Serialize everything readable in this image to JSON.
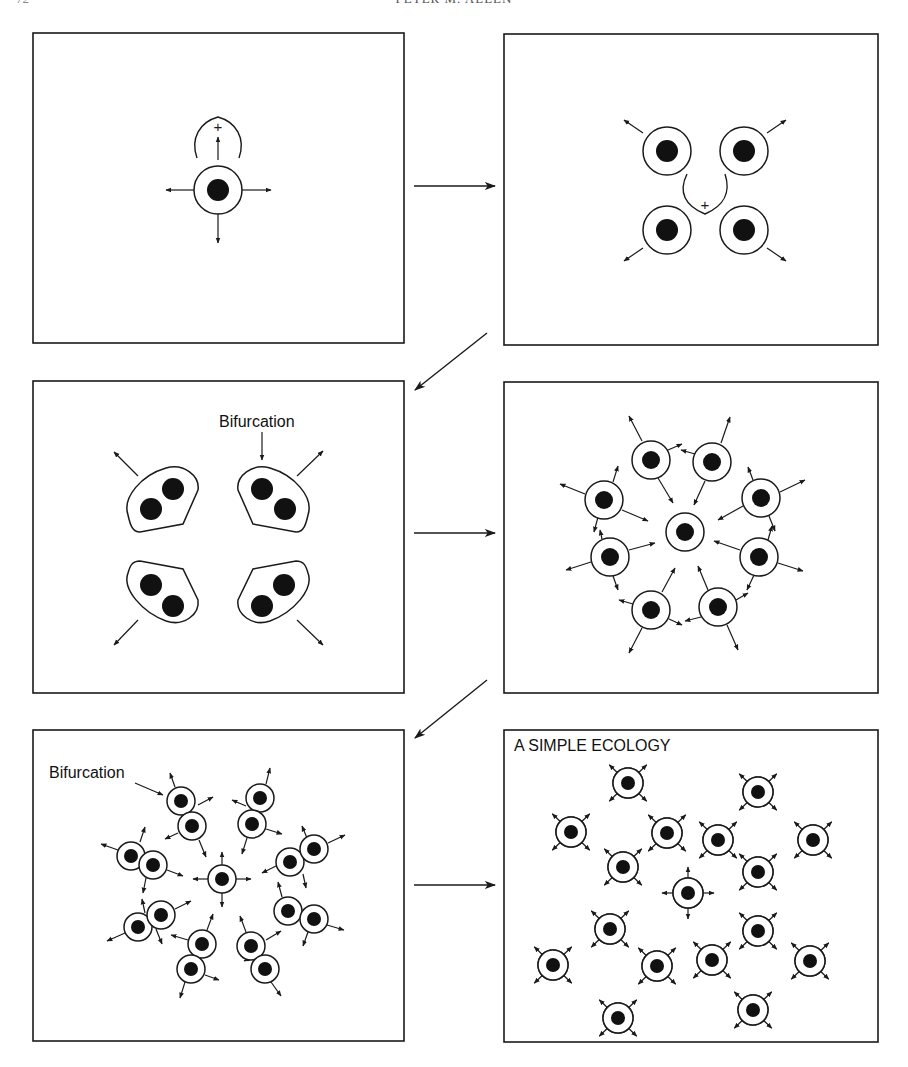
{
  "header": {
    "page_number": "72",
    "running_head": "PETER M. ALLEN"
  },
  "colors": {
    "stroke": "#1a1a1a",
    "nucleus": "#111111",
    "background": "#ffffff"
  },
  "panels": [
    {
      "id": "panel-1",
      "box": [
        33,
        33,
        371,
        310
      ],
      "label": "",
      "cells": [
        {
          "x": 218,
          "y": 190,
          "r": 24,
          "n": 11
        }
      ],
      "arrows": [
        [
          218,
          160,
          218,
          137
        ],
        [
          195,
          190,
          166,
          190
        ],
        [
          241,
          190,
          271,
          190
        ],
        [
          218,
          214,
          218,
          243
        ]
      ],
      "curves": [
        {
          "d": "M197,158 C190,138 200,122 218,117 C236,122 246,138 239,158"
        }
      ],
      "plus": [
        {
          "x": 218,
          "y": 127
        }
      ]
    },
    {
      "id": "panel-2",
      "box": [
        504,
        34,
        374,
        311
      ],
      "label": "",
      "cells": [
        {
          "x": 667,
          "y": 151,
          "r": 24,
          "n": 11
        },
        {
          "x": 744,
          "y": 151,
          "r": 24,
          "n": 11
        },
        {
          "x": 667,
          "y": 230,
          "r": 24,
          "n": 11
        },
        {
          "x": 744,
          "y": 230,
          "r": 24,
          "n": 11
        }
      ],
      "arrows": [
        [
          643,
          133,
          624,
          120
        ],
        [
          767,
          133,
          786,
          120
        ],
        [
          643,
          248,
          624,
          261
        ],
        [
          767,
          248,
          786,
          261
        ]
      ],
      "curves": [
        {
          "d": "M687,174 C678,192 685,206 705,214 C724,206 731,192 725,174"
        }
      ],
      "plus": [
        {
          "x": 705,
          "y": 205
        }
      ]
    },
    {
      "id": "panel-3",
      "box": [
        33,
        381,
        371,
        312
      ],
      "label": "Bifurcation",
      "label_pos": [
        219,
        427
      ],
      "label_arrow": [
        262,
        432,
        262,
        460
      ],
      "blobs": [
        {
          "d": "M128,515 C122,497 142,475 166,468 C184,463 200,476 198,490 L183,524 L140,532 C132,532 130,524 128,515 Z",
          "nuclei": [
            [
              173,
              489
            ],
            [
              151,
              509
            ]
          ]
        },
        {
          "d": "M308,515 C314,497 294,475 270,468 C252,463 236,476 238,490 L253,524 L296,532 C304,532 306,524 308,515 Z",
          "nuclei": [
            [
              262,
              489
            ],
            [
              285,
              509
            ]
          ]
        },
        {
          "d": "M128,573 C122,589 142,612 166,621 C184,627 200,614 198,600 L183,569 L140,561 C132,561 130,566 128,573 Z",
          "nuclei": [
            [
              151,
              585
            ],
            [
              173,
              606
            ]
          ]
        },
        {
          "d": "M308,573 C314,589 294,612 270,621 C252,627 236,614 238,600 L253,569 L296,561 C304,561 306,566 308,573 Z",
          "nuclei": [
            [
              284,
              585
            ],
            [
              262,
              606
            ]
          ]
        }
      ],
      "arrows": [
        [
          138,
          476,
          114,
          452
        ],
        [
          297,
          476,
          323,
          451
        ],
        [
          138,
          620,
          114,
          645
        ],
        [
          297,
          620,
          323,
          645
        ]
      ]
    },
    {
      "id": "panel-4",
      "box": [
        504,
        382,
        374,
        311
      ],
      "label": "",
      "cells": [
        {
          "x": 685,
          "y": 532,
          "r": 19,
          "n": 9
        },
        {
          "x": 651,
          "y": 460,
          "r": 19,
          "n": 9
        },
        {
          "x": 712,
          "y": 462,
          "r": 19,
          "n": 9
        },
        {
          "x": 604,
          "y": 500,
          "r": 19,
          "n": 9
        },
        {
          "x": 761,
          "y": 498,
          "r": 19,
          "n": 9
        },
        {
          "x": 610,
          "y": 557,
          "r": 19,
          "n": 9
        },
        {
          "x": 759,
          "y": 557,
          "r": 19,
          "n": 9
        },
        {
          "x": 651,
          "y": 610,
          "r": 19,
          "n": 9
        },
        {
          "x": 718,
          "y": 607,
          "r": 19,
          "n": 9
        }
      ],
      "arrows": [
        [
          642,
          441,
          629,
          416
        ],
        [
          668,
          450,
          682,
          444
        ],
        [
          658,
          478,
          673,
          503
        ],
        [
          721,
          443,
          730,
          417
        ],
        [
          695,
          454,
          681,
          450
        ],
        [
          705,
          481,
          694,
          505
        ],
        [
          585,
          494,
          560,
          484
        ],
        [
          613,
          482,
          618,
          466
        ],
        [
          622,
          510,
          648,
          521
        ],
        [
          598,
          517,
          594,
          532
        ],
        [
          780,
          492,
          805,
          480
        ],
        [
          753,
          480,
          748,
          467
        ],
        [
          743,
          506,
          718,
          520
        ],
        [
          769,
          516,
          775,
          531
        ],
        [
          591,
          562,
          566,
          570
        ],
        [
          629,
          550,
          655,
          543
        ],
        [
          613,
          576,
          618,
          590
        ],
        [
          602,
          539,
          600,
          530
        ],
        [
          778,
          563,
          803,
          571
        ],
        [
          740,
          550,
          714,
          541
        ],
        [
          768,
          540,
          772,
          526
        ],
        [
          754,
          575,
          747,
          590
        ],
        [
          642,
          628,
          629,
          653
        ],
        [
          662,
          592,
          675,
          568
        ],
        [
          633,
          604,
          619,
          600
        ],
        [
          669,
          619,
          682,
          625
        ],
        [
          727,
          625,
          738,
          650
        ],
        [
          708,
          590,
          698,
          566
        ],
        [
          736,
          600,
          748,
          593
        ],
        [
          701,
          617,
          685,
          621
        ]
      ]
    },
    {
      "id": "panel-5",
      "box": [
        33,
        730,
        371,
        311
      ],
      "label": "Bifurcation",
      "label_pos": [
        49,
        778
      ],
      "label_arrow": [
        135,
        783,
        163,
        795
      ],
      "cells": [
        {
          "x": 222,
          "y": 879,
          "r": 14,
          "n": 7
        },
        {
          "x": 181,
          "y": 801,
          "r": 14,
          "n": 7
        },
        {
          "x": 192,
          "y": 826,
          "r": 14,
          "n": 7
        },
        {
          "x": 260,
          "y": 798,
          "r": 14,
          "n": 7
        },
        {
          "x": 252,
          "y": 824,
          "r": 14,
          "n": 7
        },
        {
          "x": 131,
          "y": 856,
          "r": 14,
          "n": 7
        },
        {
          "x": 153,
          "y": 865,
          "r": 14,
          "n": 7
        },
        {
          "x": 290,
          "y": 862,
          "r": 14,
          "n": 7
        },
        {
          "x": 314,
          "y": 849,
          "r": 14,
          "n": 7
        },
        {
          "x": 138,
          "y": 927,
          "r": 14,
          "n": 7
        },
        {
          "x": 161,
          "y": 915,
          "r": 14,
          "n": 7
        },
        {
          "x": 288,
          "y": 911,
          "r": 14,
          "n": 7
        },
        {
          "x": 314,
          "y": 919,
          "r": 14,
          "n": 7
        },
        {
          "x": 202,
          "y": 944,
          "r": 14,
          "n": 7
        },
        {
          "x": 191,
          "y": 969,
          "r": 14,
          "n": 7
        },
        {
          "x": 251,
          "y": 946,
          "r": 14,
          "n": 7
        },
        {
          "x": 265,
          "y": 969,
          "r": 14,
          "n": 7
        }
      ],
      "arrows": [
        [
          222,
          865,
          222,
          852
        ],
        [
          208,
          879,
          193,
          879
        ],
        [
          236,
          879,
          251,
          879
        ],
        [
          222,
          893,
          222,
          907
        ],
        [
          175,
          787,
          170,
          773
        ],
        [
          198,
          805,
          213,
          797
        ],
        [
          178,
          833,
          165,
          839
        ],
        [
          199,
          840,
          206,
          857
        ],
        [
          266,
          784,
          270,
          768
        ],
        [
          246,
          806,
          232,
          800
        ],
        [
          266,
          829,
          282,
          834
        ],
        [
          247,
          838,
          242,
          854
        ],
        [
          118,
          850,
          101,
          844
        ],
        [
          140,
          842,
          145,
          827
        ],
        [
          167,
          870,
          183,
          876
        ],
        [
          146,
          878,
          143,
          893
        ],
        [
          328,
          843,
          345,
          835
        ],
        [
          307,
          838,
          302,
          826
        ],
        [
          276,
          866,
          262,
          873
        ],
        [
          303,
          874,
          306,
          888
        ],
        [
          125,
          933,
          107,
          941
        ],
        [
          175,
          909,
          191,
          901
        ],
        [
          145,
          913,
          142,
          899
        ],
        [
          156,
          929,
          162,
          944
        ],
        [
          327,
          925,
          344,
          930
        ],
        [
          282,
          897,
          278,
          882
        ],
        [
          300,
          907,
          285,
          901
        ],
        [
          308,
          932,
          303,
          946
        ],
        [
          207,
          930,
          213,
          914
        ],
        [
          188,
          940,
          171,
          935
        ],
        [
          185,
          982,
          180,
          998
        ],
        [
          205,
          975,
          219,
          980
        ],
        [
          246,
          932,
          240,
          916
        ],
        [
          258,
          955,
          244,
          961
        ],
        [
          271,
          982,
          281,
          996
        ],
        [
          266,
          940,
          281,
          931
        ]
      ]
    },
    {
      "id": "panel-6",
      "box": [
        504,
        730,
        374,
        312
      ],
      "label": "A SIMPLE ECOLOGY",
      "label_pos": [
        514,
        751
      ],
      "cells": [
        {
          "x": 628,
          "y": 783,
          "r": 15,
          "n": 7
        },
        {
          "x": 758,
          "y": 792,
          "r": 15,
          "n": 7
        },
        {
          "x": 571,
          "y": 832,
          "r": 15,
          "n": 7
        },
        {
          "x": 667,
          "y": 833,
          "r": 15,
          "n": 7
        },
        {
          "x": 718,
          "y": 840,
          "r": 15,
          "n": 7
        },
        {
          "x": 813,
          "y": 840,
          "r": 15,
          "n": 7
        },
        {
          "x": 623,
          "y": 867,
          "r": 15,
          "n": 7
        },
        {
          "x": 758,
          "y": 872,
          "r": 15,
          "n": 7
        },
        {
          "x": 688,
          "y": 893,
          "r": 15,
          "n": 7
        },
        {
          "x": 610,
          "y": 929,
          "r": 15,
          "n": 7
        },
        {
          "x": 758,
          "y": 931,
          "r": 15,
          "n": 7
        },
        {
          "x": 553,
          "y": 965,
          "r": 15,
          "n": 7
        },
        {
          "x": 657,
          "y": 966,
          "r": 15,
          "n": 7
        },
        {
          "x": 712,
          "y": 960,
          "r": 15,
          "n": 7
        },
        {
          "x": 810,
          "y": 961,
          "r": 15,
          "n": 7
        },
        {
          "x": 618,
          "y": 1018,
          "r": 15,
          "n": 7
        },
        {
          "x": 753,
          "y": 1010,
          "r": 15,
          "n": 7
        }
      ],
      "arrow_len": 11,
      "cell_arrows": "diagonal",
      "center_cell_index": 8
    }
  ],
  "transitions": [
    {
      "from": "panel-1",
      "to": "panel-2",
      "line": [
        414,
        186,
        495,
        186
      ]
    },
    {
      "from": "panel-2",
      "to": "panel-3",
      "line": [
        487,
        333,
        415,
        390
      ]
    },
    {
      "from": "panel-3",
      "to": "panel-4",
      "line": [
        414,
        533,
        495,
        533
      ]
    },
    {
      "from": "panel-4",
      "to": "panel-5",
      "line": [
        487,
        680,
        415,
        738
      ]
    },
    {
      "from": "panel-5",
      "to": "panel-6",
      "line": [
        414,
        885,
        495,
        885
      ]
    }
  ]
}
